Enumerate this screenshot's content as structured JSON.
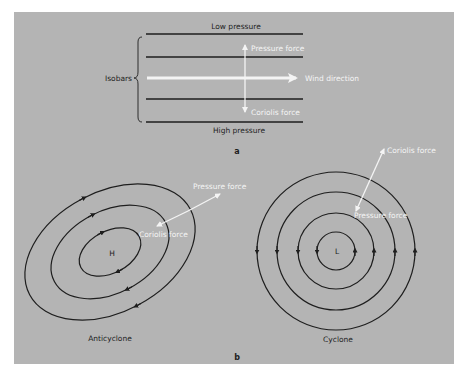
{
  "figure": {
    "background_color": "#b4b4b4",
    "line_color": "#1e1e1e",
    "arrow_color": "#f4f4f4"
  },
  "panel_a": {
    "tag": "a",
    "top_label": "Low pressure",
    "bottom_label": "High pressure",
    "bracket_label": "Isobars",
    "pressure_force_label": "Pressure force",
    "wind_direction_label": "Wind direction",
    "coriolis_force_label": "Coriolis force",
    "isobar_count": 4
  },
  "panel_b": {
    "tag": "b",
    "anticyclone": {
      "caption": "Anticyclone",
      "center_label": "H",
      "pressure_force_label": "Pressure force",
      "coriolis_force_label": "Coriolis force",
      "rotation": "clockwise",
      "ring_count": 3
    },
    "cyclone": {
      "caption": "Cyclone",
      "center_label": "L",
      "pressure_force_label": "Pressure force",
      "coriolis_force_label": "Coriolis force",
      "rotation": "counterclockwise",
      "ring_count": 4
    }
  }
}
